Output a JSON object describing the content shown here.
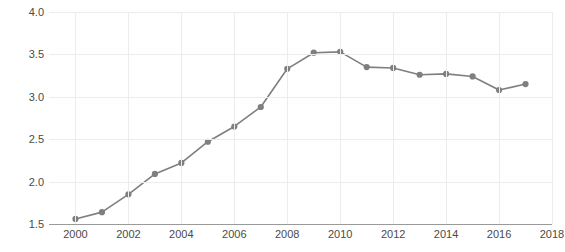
{
  "chart_data": {
    "type": "line",
    "title": "",
    "xlabel": "",
    "ylabel": "Billions of dollars",
    "xlim": [
      1999,
      2018
    ],
    "ylim": [
      1.5,
      4.0
    ],
    "xticks": [
      2000,
      2002,
      2004,
      2006,
      2008,
      2010,
      2012,
      2014,
      2016,
      2018
    ],
    "xtick_labels": [
      "2000",
      "2002",
      "2004",
      "2006",
      "2008",
      "2010",
      "2012",
      "2014",
      "2016",
      "2018"
    ],
    "yticks": [
      1.5,
      2.0,
      2.5,
      3.0,
      3.5,
      4.0
    ],
    "ytick_labels": [
      "1.5",
      "2.0",
      "2.5",
      "3.0",
      "3.5",
      "4.0"
    ],
    "grid": true,
    "legend": "none",
    "markers": "circle",
    "line_color": "#7f7f7f",
    "marker_color": "#7f7f7f",
    "grid_color": "#ececec",
    "axis_color": "#9a9a9a",
    "text_color": "#4a4a4a",
    "x": [
      2000,
      2001,
      2002,
      2003,
      2004,
      2005,
      2006,
      2007,
      2008,
      2009,
      2010,
      2011,
      2012,
      2013,
      2014,
      2015,
      2016,
      2017
    ],
    "values": [
      1.56,
      1.64,
      1.85,
      2.09,
      2.22,
      2.47,
      2.65,
      2.88,
      3.33,
      3.52,
      3.53,
      3.35,
      3.34,
      3.26,
      3.27,
      3.24,
      3.08,
      3.15
    ],
    "series": [
      {
        "name": "Billions of dollars",
        "values": [
          1.56,
          1.64,
          1.85,
          2.09,
          2.22,
          2.47,
          2.65,
          2.88,
          3.33,
          3.52,
          3.53,
          3.35,
          3.34,
          3.26,
          3.27,
          3.24,
          3.08,
          3.15
        ]
      }
    ]
  }
}
